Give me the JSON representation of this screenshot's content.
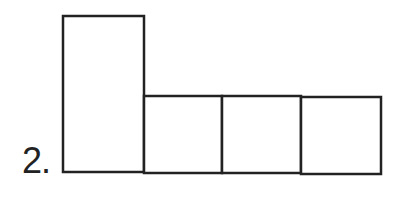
{
  "item": {
    "number_label": "2."
  },
  "figure": {
    "stroke_color": "#222222",
    "fill_color": "#ffffff",
    "stroke_width": 2.5,
    "shapes": [
      {
        "name": "tall-rectangle",
        "x": 63,
        "y": 16,
        "w": 81,
        "h": 156
      },
      {
        "name": "square-1",
        "x": 144,
        "y": 96,
        "w": 78,
        "h": 77
      },
      {
        "name": "square-2",
        "x": 222,
        "y": 96,
        "w": 79,
        "h": 77
      },
      {
        "name": "square-3",
        "x": 301,
        "y": 97,
        "w": 80,
        "h": 77
      }
    ]
  }
}
